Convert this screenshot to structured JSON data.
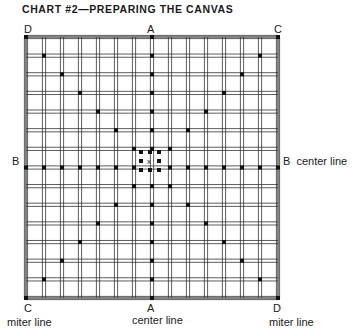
{
  "title": "CHART #2—PREPARING THE CANVAS",
  "labels": {
    "top_left": "D",
    "top_center": "A",
    "top_right": "C",
    "left_center": "B",
    "right_center": "B  center line",
    "bottom_left": "C",
    "bottom_center": "A",
    "bottom_right": "D",
    "bottom_left_caption": "miter line",
    "bottom_center_caption": "center line",
    "bottom_right_caption": "miter line"
  },
  "grid": {
    "left": 26,
    "top": 37,
    "right": 278,
    "bottom": 298,
    "center_x": 150,
    "center_y": 161,
    "columns": 15,
    "rows": 15,
    "thread_color": "#333333",
    "stitch_color": "#111111"
  },
  "diagram_description": {
    "center_lines": [
      "A-A vertical center line",
      "B-B horizontal center line"
    ],
    "miter_lines": [
      "D-D diagonal",
      "C-C diagonal"
    ],
    "center_mark": "x"
  }
}
